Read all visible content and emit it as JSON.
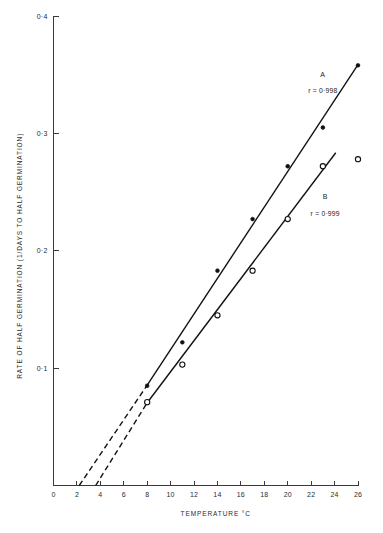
{
  "chart_data": {
    "type": "scatter",
    "title": "",
    "subtitle": "",
    "xlabel": "TEMPERATURE °C",
    "ylabel": "RATE OF HALF GERMINATION   (1/DAYS TO HALF GERMINATION)",
    "xlim": [
      0,
      26
    ],
    "ylim": [
      0,
      0.4
    ],
    "grid": false,
    "legend_position": "inline-annotations",
    "x_ticks": [
      0,
      2,
      4,
      6,
      8,
      10,
      12,
      14,
      16,
      18,
      20,
      22,
      24,
      26
    ],
    "x_tick_labels": [
      "0",
      "2",
      "4",
      "6",
      "8",
      "10",
      "12",
      "14",
      "16",
      "18",
      "20",
      "22",
      "24",
      "26"
    ],
    "y_ticks": [
      0.1,
      0.2,
      0.3,
      0.4
    ],
    "y_tick_labels": [
      "0·1",
      "0·2",
      "0·3",
      "0·4"
    ],
    "series": [
      {
        "name": "A",
        "marker": "filled-circle",
        "annotation_label": "A",
        "annotation_r": "r = 0·998",
        "correlation": 0.998,
        "points": [
          {
            "x": 8,
            "y": 0.085
          },
          {
            "x": 11,
            "y": 0.122
          },
          {
            "x": 14,
            "y": 0.183
          },
          {
            "x": 17,
            "y": 0.227
          },
          {
            "x": 20,
            "y": 0.272
          },
          {
            "x": 23,
            "y": 0.305
          },
          {
            "x": 26,
            "y": 0.358
          }
        ],
        "fit_line": {
          "solid_from": {
            "x": 8,
            "y": 0.0855
          },
          "solid_to": {
            "x": 26,
            "y": 0.3585
          },
          "dashed_from": {
            "x": 2.2,
            "y": 0.0
          },
          "dashed_to": {
            "x": 8,
            "y": 0.0855
          }
        },
        "x_intercept": 2.2
      },
      {
        "name": "B",
        "marker": "open-circle",
        "annotation_label": "B",
        "annotation_r": "r = 0·999",
        "correlation": 0.999,
        "points": [
          {
            "x": 8,
            "y": 0.071
          },
          {
            "x": 11,
            "y": 0.103
          },
          {
            "x": 14,
            "y": 0.145
          },
          {
            "x": 17,
            "y": 0.183
          },
          {
            "x": 20,
            "y": 0.227
          },
          {
            "x": 23,
            "y": 0.272
          },
          {
            "x": 26,
            "y": 0.278
          }
        ],
        "fit_line": {
          "solid_from": {
            "x": 8,
            "y": 0.0705
          },
          "solid_to": {
            "x": 24.1,
            "y": 0.2835
          },
          "dashed_from": {
            "x": 3.6,
            "y": 0.0
          },
          "dashed_to": {
            "x": 8,
            "y": 0.0705
          }
        },
        "x_intercept": 3.6
      }
    ],
    "annotations": [
      {
        "text": "A",
        "x": 23.0,
        "y": 0.348
      },
      {
        "text": "r = 0·998",
        "x": 23.0,
        "y": 0.334
      },
      {
        "text": "B",
        "x": 23.2,
        "y": 0.244
      },
      {
        "text": "r = 0·999",
        "x": 23.2,
        "y": 0.23
      }
    ]
  },
  "axes": {
    "y_title": "RATE OF HALF GERMINATION   (1/DAYS TO HALF GERMINATION)",
    "x_title": "TEMPERATURE °C",
    "y_label_0": "0·4",
    "y_label_1": "0·3",
    "y_label_2": "0·2",
    "y_label_3": "0·1",
    "x_label_0": "0",
    "x_label_1": "2",
    "x_label_2": "4",
    "x_label_3": "6",
    "x_label_4": "8",
    "x_label_5": "10",
    "x_label_6": "12",
    "x_label_7": "14",
    "x_label_8": "16",
    "x_label_9": "18",
    "x_label_10": "20",
    "x_label_11": "22",
    "x_label_12": "24",
    "x_label_13": "26"
  },
  "labels": {
    "series_a_name": "A",
    "series_a_r": "r = 0·998",
    "series_b_name": "B",
    "series_b_r": "r = 0·999"
  },
  "colors": {
    "line": "#121212",
    "axis": "#3a3a3a",
    "text": "#2b2b2b",
    "background": "#ffffff"
  }
}
